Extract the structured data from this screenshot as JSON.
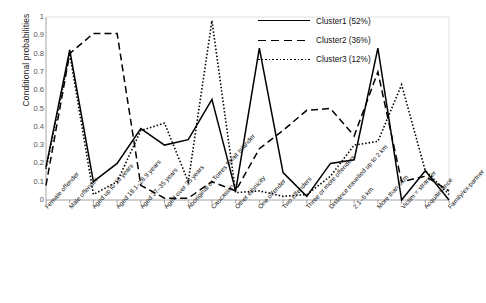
{
  "chart_data": {
    "type": "line",
    "title": "",
    "xlabel": "",
    "ylabel": "Conditional probabilities",
    "ylim": [
      0,
      1
    ],
    "ytick_labels": [
      "1",
      "0.9",
      "0.8",
      "0.7",
      "0.6",
      "0.5",
      "0.4",
      "0.3",
      "0.2",
      "0.1",
      "0"
    ],
    "ytick_values": [
      1,
      0.9,
      0.8,
      0.7,
      0.6,
      0.5,
      0.4,
      0.3,
      0.2,
      0.1,
      0
    ],
    "grid": false,
    "legend_position": "top-right",
    "categories": [
      "Female offender",
      "Male offender",
      "Aged up to 18 years",
      "Aged 18.1–28.9 years",
      "Aged 27–35 years",
      "Aged over 35 years",
      "Aboriginal or Torres Strait Islander",
      "Caucasian",
      "Other ethnicity",
      "One offender",
      "Two offenders",
      "Three or more offenders",
      "Distance travelled up to 2 km",
      "2.1–6 km",
      "More than 6km",
      "Victim = stranger",
      "Acquaintance",
      "Family/ex-partner"
    ],
    "series": [
      {
        "name": "Cluster1 (52%)",
        "style": "solid",
        "color": "#000000",
        "values": [
          0.18,
          0.82,
          0.1,
          0.2,
          0.39,
          0.3,
          0.33,
          0.55,
          0.05,
          0.83,
          0.15,
          0.02,
          0.2,
          0.22,
          0.83,
          0.0,
          0.16,
          0.0
        ]
      },
      {
        "name": "Cluster2 (36%)",
        "style": "dashed",
        "color": "#000000",
        "values": [
          0.08,
          0.8,
          0.91,
          0.91,
          0.08,
          0.01,
          0.01,
          0.1,
          0.05,
          0.28,
          0.38,
          0.49,
          0.5,
          0.35,
          0.7,
          0.1,
          0.13,
          0.05
        ]
      },
      {
        "name": "Cluster3 (12%)",
        "style": "dotted",
        "color": "#000000",
        "values": [
          0.17,
          0.8,
          0.03,
          0.1,
          0.38,
          0.42,
          0.1,
          0.98,
          0.04,
          0.05,
          0.02,
          0.03,
          0.13,
          0.3,
          0.32,
          0.63,
          0.16,
          0.03
        ]
      }
    ]
  },
  "legend": {
    "items": [
      {
        "label": "Cluster1 (52%)",
        "style": "solid"
      },
      {
        "label": "Cluster2 (36%)",
        "style": "dashed"
      },
      {
        "label": "Cluster3 (12%)",
        "style": "dotted"
      }
    ]
  }
}
